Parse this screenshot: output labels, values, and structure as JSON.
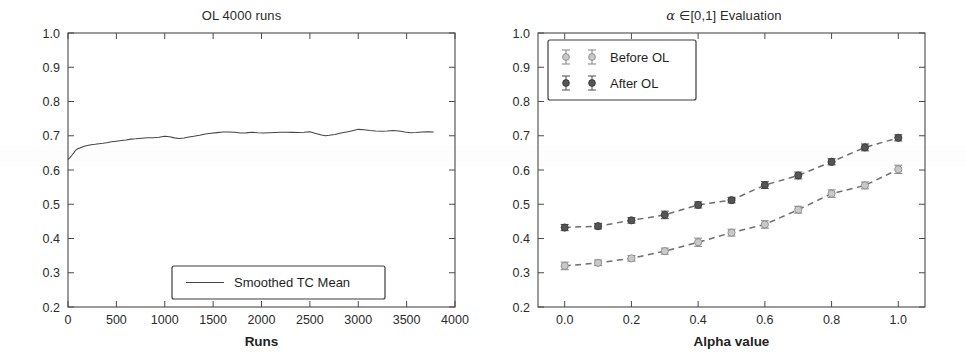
{
  "figure": {
    "background_color": "#ffffff",
    "width": 965,
    "height": 354
  },
  "panels": {
    "left": {
      "title": "OL 4000 runs",
      "xlabel": "Runs",
      "ylabel": "",
      "legend_label": "Smoothed TC Mean"
    },
    "right": {
      "title_alpha": "α",
      "title_in": "∈",
      "title_range": "[0,1]",
      "title_rest": "Evaluation",
      "title_full": "α ∈[0,1] Evaluation",
      "xlabel": "Alpha value",
      "ylabel": "",
      "legend_before": "Before OL",
      "legend_after": "After OL"
    }
  },
  "colors": {
    "line_solid": "#454545",
    "line_dashed": "#6e6e6e",
    "marker_after": "#555555",
    "marker_before": "#c9c9c9",
    "frame": "#4a4a4a",
    "text": "#1f1f1f"
  },
  "chart_data": [
    {
      "type": "line",
      "panel": "left",
      "title": "OL 4000 runs",
      "xlabel": "Runs",
      "ylabel": "",
      "xlim": [
        0,
        4000
      ],
      "ylim": [
        0.2,
        1.0
      ],
      "xticks": [
        0,
        500,
        1000,
        1500,
        2000,
        2500,
        3000,
        3500,
        4000
      ],
      "xtick_labels": [
        "0",
        "500",
        "1000",
        "1500",
        "2000",
        "2500",
        "3000",
        "3500",
        "4000"
      ],
      "yticks": [
        0.2,
        0.3,
        0.4,
        0.5,
        0.6,
        0.7,
        0.8,
        0.9,
        1.0
      ],
      "ytick_labels": [
        "0.2",
        "0.3",
        "0.4",
        "0.5",
        "0.6",
        "0.7",
        "0.8",
        "0.9",
        "1.0"
      ],
      "grid": false,
      "legend_position": "lower center",
      "series": [
        {
          "name": "Smoothed TC Mean",
          "x": [
            0,
            20,
            40,
            60,
            80,
            100,
            130,
            160,
            200,
            240,
            280,
            320,
            360,
            400,
            450,
            500,
            550,
            600,
            650,
            700,
            760,
            820,
            880,
            940,
            1000,
            1050,
            1100,
            1150,
            1200,
            1250,
            1300,
            1360,
            1420,
            1480,
            1540,
            1600,
            1660,
            1720,
            1780,
            1840,
            1900,
            1960,
            2020,
            2080,
            2140,
            2200,
            2260,
            2320,
            2380,
            2440,
            2500,
            2560,
            2620,
            2660,
            2700,
            2760,
            2820,
            2880,
            2940,
            3000,
            3060,
            3120,
            3180,
            3240,
            3300,
            3360,
            3420,
            3480,
            3540,
            3600,
            3660,
            3720,
            3780
          ],
          "y": [
            0.63,
            0.636,
            0.643,
            0.65,
            0.656,
            0.66,
            0.664,
            0.668,
            0.672,
            0.675,
            0.677,
            0.679,
            0.68,
            0.681,
            0.683,
            0.684,
            0.685,
            0.686,
            0.688,
            0.689,
            0.691,
            0.693,
            0.694,
            0.696,
            0.7,
            0.699,
            0.696,
            0.694,
            0.695,
            0.697,
            0.698,
            0.7,
            0.703,
            0.705,
            0.707,
            0.709,
            0.71,
            0.71,
            0.709,
            0.71,
            0.712,
            0.711,
            0.71,
            0.71,
            0.71,
            0.71,
            0.709,
            0.708,
            0.707,
            0.708,
            0.71,
            0.706,
            0.702,
            0.701,
            0.703,
            0.706,
            0.71,
            0.713,
            0.716,
            0.719,
            0.717,
            0.714,
            0.712,
            0.711,
            0.712,
            0.714,
            0.713,
            0.711,
            0.71,
            0.711,
            0.713,
            0.714,
            0.713
          ]
        }
      ]
    },
    {
      "type": "line",
      "panel": "right",
      "title": "α ∈[0,1] Evaluation",
      "xlabel": "Alpha value",
      "ylabel": "",
      "xlim": [
        -0.08,
        1.08
      ],
      "ylim": [
        0.2,
        1.0
      ],
      "xticks": [
        0.0,
        0.2,
        0.4,
        0.6,
        0.8,
        1.0
      ],
      "xtick_labels": [
        "0.0",
        "0.2",
        "0.4",
        "0.6",
        "0.8",
        "1.0"
      ],
      "yticks": [
        0.2,
        0.3,
        0.4,
        0.5,
        0.6,
        0.7,
        0.8,
        0.9,
        1.0
      ],
      "ytick_labels": [
        "0.2",
        "0.3",
        "0.4",
        "0.5",
        "0.6",
        "0.7",
        "0.8",
        "0.9",
        "1.0"
      ],
      "grid": false,
      "legend_position": "upper left",
      "has_error_bars": true,
      "categories": [
        0.0,
        0.1,
        0.2,
        0.3,
        0.4,
        0.5,
        0.6,
        0.7,
        0.8,
        0.9,
        1.0
      ],
      "series": [
        {
          "name": "Before OL",
          "marker": "open",
          "values": [
            0.32,
            0.329,
            0.342,
            0.363,
            0.389,
            0.417,
            0.441,
            0.484,
            0.531,
            0.555,
            0.602
          ],
          "errors": [
            0.011,
            0.008,
            0.008,
            0.009,
            0.012,
            0.01,
            0.011,
            0.01,
            0.011,
            0.01,
            0.012
          ]
        },
        {
          "name": "After OL",
          "marker": "filled",
          "values": [
            0.432,
            0.436,
            0.453,
            0.469,
            0.498,
            0.512,
            0.556,
            0.584,
            0.624,
            0.666,
            0.694
          ],
          "errors": [
            0.009,
            0.008,
            0.008,
            0.011,
            0.009,
            0.008,
            0.01,
            0.01,
            0.009,
            0.01,
            0.009
          ]
        }
      ]
    }
  ]
}
